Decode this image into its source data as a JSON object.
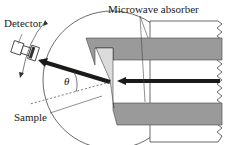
{
  "diagram": {
    "labels": {
      "detector": "Detector",
      "absorber": "Microwave absorber",
      "sample": "Sample",
      "theta": "θ"
    },
    "colors": {
      "line": "#333333",
      "absorber_fill": "#9a9a9a",
      "sample_fill": "#dcdcdc",
      "beam": "#1a1a1a"
    }
  }
}
